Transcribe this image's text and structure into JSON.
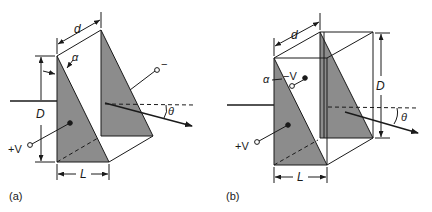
{
  "figure": {
    "colors": {
      "line": "#1a1a1a",
      "prism_fill": "#8c8c8c",
      "background": "#ffffff"
    },
    "panels": [
      {
        "id": "a",
        "caption": "(a)",
        "labels": {
          "depth": "d",
          "height": "D",
          "length": "L",
          "apex_angle": "α",
          "deflection_angle": "θ",
          "positive_terminal": "+V",
          "negative_terminal": "−"
        }
      },
      {
        "id": "b",
        "caption": "(b)",
        "labels": {
          "depth": "d",
          "height": "D",
          "length": "L",
          "apex_angle": "α",
          "deflection_angle": "θ",
          "positive_terminal": "+V",
          "negative_terminal": "−V"
        }
      }
    ]
  }
}
